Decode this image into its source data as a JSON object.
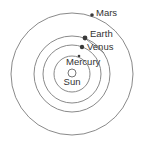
{
  "diagram": {
    "type": "solar-system-orbits",
    "center": {
      "x": 72,
      "y": 74
    },
    "colors": {
      "orbit": "#8a8a8a",
      "planet": "#3a3a3a",
      "text": "#333333",
      "sun_outline": "#666666"
    },
    "sun": {
      "label": "Sun",
      "radius": 4
    },
    "planets": [
      {
        "name": "Mercury",
        "label": "Mercury",
        "orbit_radius": 18,
        "dot": {
          "x": 79,
          "y": 56,
          "r": 1.3
        },
        "label_pos": {
          "x": 66,
          "y": 65
        }
      },
      {
        "name": "Venus",
        "label": "Venus",
        "orbit_radius": 29,
        "dot": {
          "x": 82,
          "y": 47,
          "r": 2.2
        },
        "label_pos": {
          "x": 87,
          "y": 50
        }
      },
      {
        "name": "Earth",
        "label": "Earth",
        "orbit_radius": 38,
        "dot": {
          "x": 85,
          "y": 38,
          "r": 2.4
        },
        "label_pos": {
          "x": 90,
          "y": 37
        }
      },
      {
        "name": "Mars",
        "label": "Mars",
        "orbit_radius": 61,
        "dot": {
          "x": 92,
          "y": 15,
          "r": 1.8
        },
        "label_pos": {
          "x": 96,
          "y": 16
        }
      }
    ]
  }
}
